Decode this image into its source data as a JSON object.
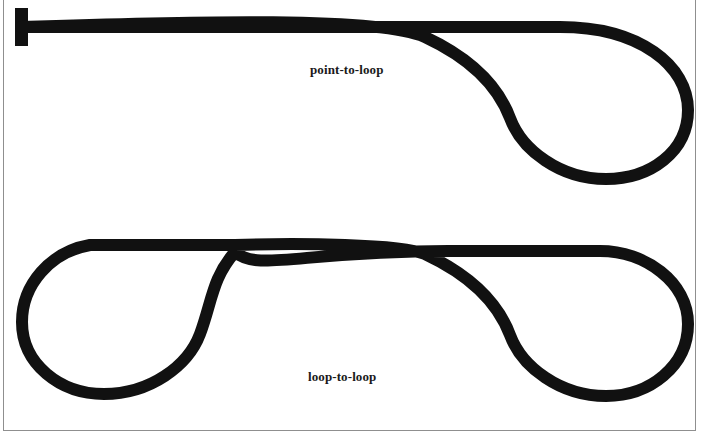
{
  "figure": {
    "background_color": "#ffffff",
    "stroke_color": "#111111",
    "border_color": "#8f8f8f",
    "stroke_width": 12,
    "width": 710,
    "height": 446,
    "diagrams": [
      {
        "id": "point-to-loop",
        "label": "point-to-loop",
        "description": "A straight shaft beginning at a T-shaped point terminal on the left, running horizontally to the right, then curving into a single teardrop loop.",
        "terminal_left": "point",
        "terminal_right": "loop",
        "loop_count": 1,
        "cusp_points": [
          [
            425,
            37
          ]
        ],
        "bounds": [
          15,
          8,
          688,
          173
        ]
      },
      {
        "id": "loop-to-loop",
        "label": "loop-to-loop",
        "description": "A horizontal shaft terminating in a teardrop loop at each end, the left loop mirroring the right loop.",
        "terminal_left": "loop",
        "terminal_right": "loop",
        "loop_count": 2,
        "cusp_points": [
          [
            235,
            252
          ],
          [
            448,
            253
          ]
        ],
        "bounds": [
          20,
          239,
          688,
          400
        ]
      }
    ],
    "captions": {
      "top": "point-to-loop",
      "bottom": "loop-to-loop"
    }
  }
}
